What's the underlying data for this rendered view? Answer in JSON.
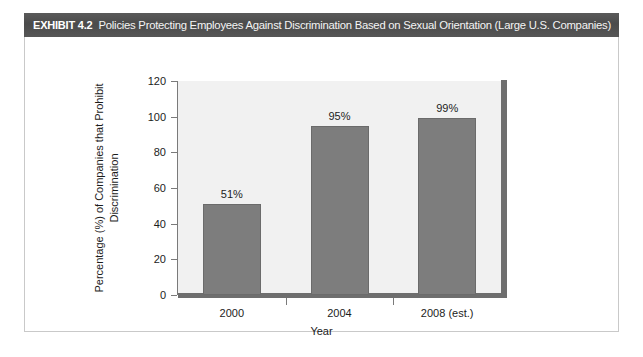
{
  "exhibit": {
    "number": "EXHIBIT 4.2",
    "title": "Policies Protecting Employees Against Discrimination Based on Sexual Orientation (Large U.S. Companies)",
    "header_bg": "#4b4b4b",
    "header_text_color": "#ffffff"
  },
  "chart_data": {
    "type": "bar",
    "title": "Policies Protecting Employees Against Discrimination Based on Sexual Orientation (Large U.S. Companies)",
    "categories": [
      "2000",
      "2004",
      "2008 (est.)"
    ],
    "values": [
      51,
      95,
      99
    ],
    "data_labels": [
      "51%",
      "95%",
      "99%"
    ],
    "xlabel": "Year",
    "ylabel": "Percentage (%) of Companies that Prohibit Discrimination",
    "ylabel_line1": "Percentage (%) of Companies that Prohibit",
    "ylabel_line2": "Discrimination",
    "ylim": [
      0,
      120
    ],
    "yticks": [
      0,
      20,
      40,
      60,
      80,
      100,
      120
    ],
    "ytick_labels": [
      "0",
      "20",
      "40",
      "60",
      "80",
      "100",
      "120"
    ],
    "grid": false,
    "legend": "none",
    "bar_color": "#7d7d7d",
    "plot_bg": "#f1f1f1",
    "axis_color": "#6e6e6e"
  }
}
